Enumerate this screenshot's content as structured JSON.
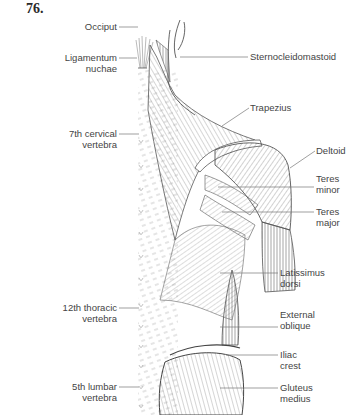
{
  "figure": {
    "number": "76."
  },
  "labels_left": [
    {
      "id": "occiput",
      "lines": [
        "Occiput"
      ]
    },
    {
      "id": "ligamentum-nuchae",
      "lines": [
        "Ligamentum",
        "nuchae"
      ]
    },
    {
      "id": "7th-cervical-vertebra",
      "lines": [
        "7th cervical",
        "vertebra"
      ]
    },
    {
      "id": "12th-thoracic-vertebra",
      "lines": [
        "12th thoracic",
        "vertebra"
      ]
    },
    {
      "id": "5th-lumbar-vertebra",
      "lines": [
        "5th lumbar",
        "vertebra"
      ]
    }
  ],
  "labels_right": [
    {
      "id": "sternocleidomastoid",
      "lines": [
        "Sternocleidomastoid"
      ]
    },
    {
      "id": "trapezius",
      "lines": [
        "Trapezius"
      ]
    },
    {
      "id": "deltoid",
      "lines": [
        "Deltoid"
      ]
    },
    {
      "id": "teres-minor",
      "lines": [
        "Teres",
        "minor"
      ]
    },
    {
      "id": "teres-major",
      "lines": [
        "Teres",
        "major"
      ]
    },
    {
      "id": "latissimus-dorsi",
      "lines": [
        "Latissimus",
        "dorsi"
      ]
    },
    {
      "id": "external-oblique",
      "lines": [
        "External",
        "oblique"
      ]
    },
    {
      "id": "iliac-crest",
      "lines": [
        "Iliac",
        "crest"
      ]
    },
    {
      "id": "gluteus-medius",
      "lines": [
        "Gluteus",
        "medius"
      ]
    }
  ],
  "colors": {
    "line": "#555555",
    "leader": "#777777",
    "text": "#444444"
  }
}
